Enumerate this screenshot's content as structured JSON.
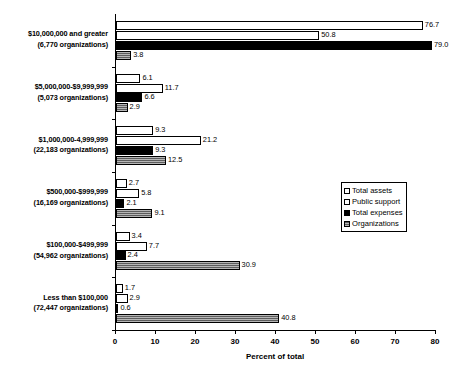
{
  "chart_data": {
    "type": "bar",
    "orientation": "horizontal",
    "title": "",
    "xlabel": "Percent of total",
    "ylabel": "",
    "xlim": [
      0,
      80
    ],
    "xticks": [
      0,
      10,
      20,
      30,
      40,
      50,
      60,
      70,
      80
    ],
    "grid": false,
    "legend_position": "center-right",
    "categories": [
      "$10,000,000 and greater (6,770 organizations)",
      "$5,000,000-$9,999,999 (5,073 organizations)",
      "$1,000,000-4,999,999 (22,183 organizations)",
      "$500,000-$999,999 (16,169 organizations)",
      "$100,000-$499,999 (54,962 organizations)",
      "Less than $100,000 (72,447 organizations)"
    ],
    "category_lines": [
      [
        "$10,000,000 and greater",
        "(6,770 organizations)"
      ],
      [
        "$5,000,000-$9,999,999",
        "(5,073 organizations)"
      ],
      [
        "$1,000,000-4,999,999",
        "(22,183 organizations)"
      ],
      [
        "$500,000-$999,999",
        "(16,169 organizations)"
      ],
      [
        "$100,000-$499,999",
        "(54,962 organizations)"
      ],
      [
        "Less than $100,000",
        "(72,447 organizations)"
      ]
    ],
    "series": [
      {
        "name": "Total assets",
        "style": "white-outline",
        "color": "#ffffff",
        "values": [
          76.7,
          6.1,
          9.3,
          2.7,
          3.4,
          1.7
        ],
        "labels": [
          "76.7",
          "6.1",
          "9.3",
          "2.7",
          "3.4",
          "1.7"
        ]
      },
      {
        "name": "Public support",
        "style": "white-outline",
        "color": "#ffffff",
        "values": [
          50.8,
          11.7,
          21.2,
          5.8,
          7.7,
          2.9
        ],
        "labels": [
          "50.8",
          "11.7",
          "21.2",
          "5.8",
          "7.7",
          "2.9"
        ]
      },
      {
        "name": "Total expenses",
        "style": "solid-black",
        "color": "#000000",
        "values": [
          79.0,
          6.6,
          9.3,
          2.1,
          2.4,
          0.6
        ],
        "labels": [
          "79.0",
          "6.6",
          "9.3",
          "2.1",
          "2.4",
          "0.6"
        ]
      },
      {
        "name": "Organizations",
        "style": "gray-hatch",
        "color": "#5d5d5d",
        "values": [
          3.8,
          2.9,
          12.5,
          9.1,
          30.9,
          40.8
        ],
        "labels": [
          "3.8",
          "2.9",
          "12.5",
          "9.1",
          "30.9",
          "40.8"
        ]
      }
    ]
  },
  "legend": {
    "items": [
      {
        "label": "Total assets",
        "swatch": "white-outline"
      },
      {
        "label": "Public support",
        "swatch": "white-outline"
      },
      {
        "label": "Total expenses",
        "swatch": "solid-black"
      },
      {
        "label": "Organizations",
        "swatch": "gray-hatch"
      }
    ]
  },
  "axis": {
    "x_tick_labels": [
      "0",
      "10",
      "20",
      "30",
      "40",
      "50",
      "60",
      "70",
      "80"
    ],
    "x_axis_title": "Percent of total"
  }
}
